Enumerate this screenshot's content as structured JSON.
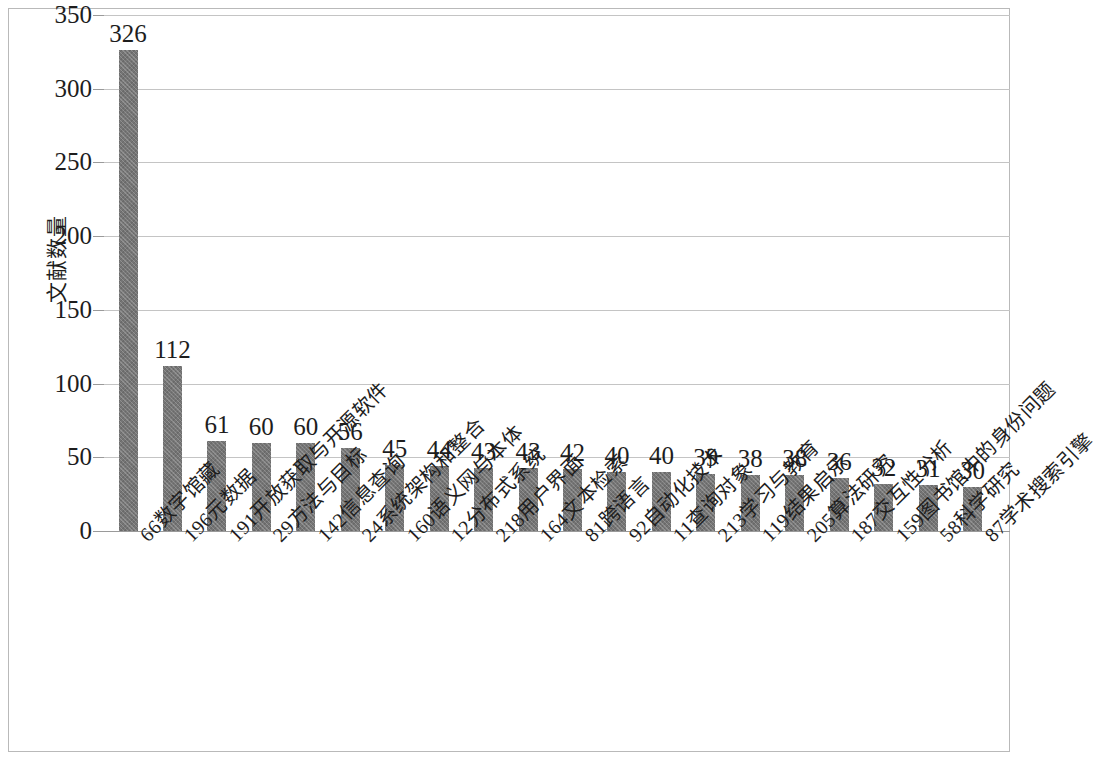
{
  "chart_data": {
    "type": "bar",
    "title": "",
    "subtitle": "",
    "xlabel": "",
    "ylabel": "文献数量",
    "ylim": [
      0,
      350
    ],
    "ytick_labels": [
      "0",
      "50",
      "100",
      "150",
      "200",
      "250",
      "300",
      "350"
    ],
    "ytick_values": [
      0,
      50,
      100,
      150,
      200,
      250,
      300,
      350
    ],
    "grid": true,
    "legend": null,
    "legend_position": "none",
    "bar_color": "#757575",
    "gridline_color": "#c4c4c4",
    "categories": [
      "66数字馆藏",
      "196元数据",
      "191开放获取与开源软件",
      "29方法与目标",
      "142信息查询",
      "24系统架构和整合",
      "160语义网与本体",
      "12分布式系统",
      "218用户界面",
      "164文本检索",
      "81跨语言",
      "92自动化技术",
      "11查询对象",
      "213学习与教育",
      "119结果启示",
      "205算法研究",
      "187交互性分析",
      "159图书馆中的身份问题",
      "58科学研究",
      "87学术搜索引擎"
    ],
    "values": [
      326,
      112,
      61,
      60,
      60,
      56,
      45,
      44,
      43,
      43,
      42,
      40,
      40,
      39,
      38,
      38,
      36,
      32,
      31,
      30
    ],
    "data_labels": [
      "326",
      "112",
      "61",
      "60",
      "60",
      "56",
      "45",
      "44",
      "43",
      "43",
      "42",
      "40",
      "40",
      "39",
      "38",
      "38",
      "36",
      "32",
      "31",
      "30"
    ]
  }
}
